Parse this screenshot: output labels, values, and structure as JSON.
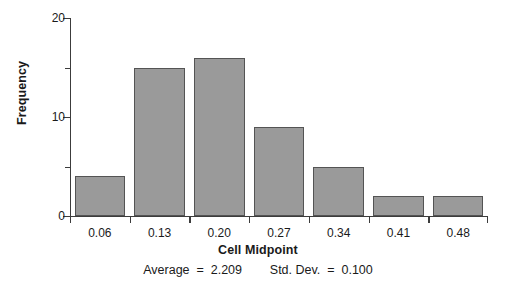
{
  "chart_data": {
    "type": "bar",
    "title": "",
    "subtitle": "",
    "xlabel": "Cell Midpoint",
    "ylabel": "Frequency",
    "categories": [
      "0.06",
      "0.13",
      "0.20",
      "0.27",
      "0.34",
      "0.41",
      "0.48"
    ],
    "values": [
      4,
      15,
      16,
      9,
      5,
      2,
      2
    ],
    "ylim": [
      0,
      20
    ],
    "yticks": [
      0,
      5,
      10,
      15,
      20
    ],
    "ytick_labels": [
      "0",
      "",
      "10",
      "",
      "20"
    ],
    "ytick_labeled": [
      true,
      false,
      true,
      false,
      true
    ],
    "grid": false,
    "legend": null,
    "bar_color": "#9a9a9a",
    "bar_edge_color": "#545454",
    "axis_color": "#3c3c3c",
    "annotations": [
      {
        "name": "average",
        "label": "Average",
        "eq": "=",
        "value": "2.209"
      },
      {
        "name": "std-dev",
        "label": "Std. Dev.",
        "eq": "=",
        "value": "0.100"
      }
    ],
    "stats_line": "Average  =  2.209        Std. Dev.  =  0.100"
  }
}
